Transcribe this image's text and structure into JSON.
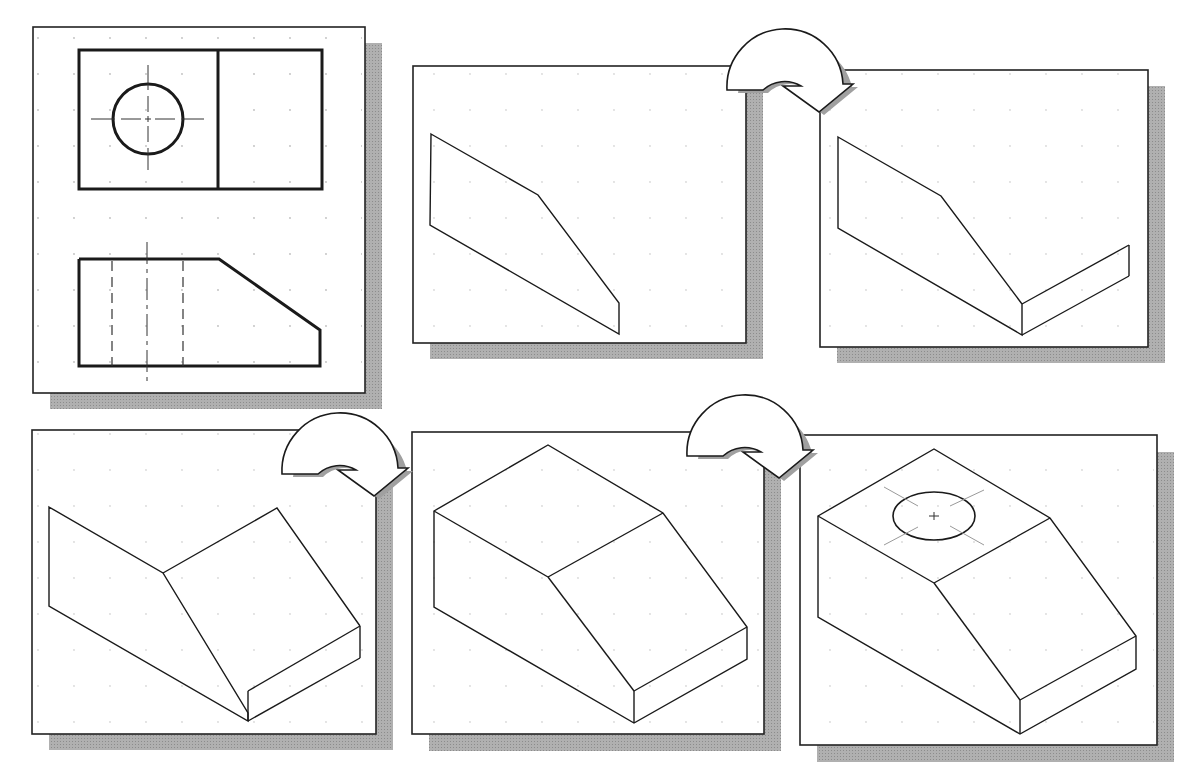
{
  "figure": {
    "colors": {
      "background": "#ffffff",
      "frame": "#222222",
      "shadow": "#a8a8a8",
      "line": "#1a1a1a",
      "grid_dot": "#bdbdbd",
      "center_line": "#9a9a9a"
    },
    "panels": [
      {
        "id": "orthographic-views",
        "step": 1,
        "content": "Top view with circular hole and front view with chamfered corner, hidden lines and center lines"
      },
      {
        "id": "isometric-front-face",
        "step": 2,
        "content": "Front face outline in isometric"
      },
      {
        "id": "isometric-front-and-bottom",
        "step": 3,
        "content": "Front face plus right side depth edges"
      },
      {
        "id": "isometric-sloped-face",
        "step": 4,
        "content": "Sloped face and right end added"
      },
      {
        "id": "isometric-top-face",
        "step": 5,
        "content": "Top face completed block"
      },
      {
        "id": "isometric-with-hole",
        "step": 6,
        "content": "Completed block with isometric ellipse hole on top"
      }
    ],
    "arrows": [
      {
        "from": 2,
        "to": 3,
        "icon": "curved-arrow-icon"
      },
      {
        "from": 4,
        "to": 5,
        "icon": "curved-arrow-icon"
      },
      {
        "from": 5,
        "to": 6,
        "icon": "curved-arrow-icon"
      }
    ]
  }
}
